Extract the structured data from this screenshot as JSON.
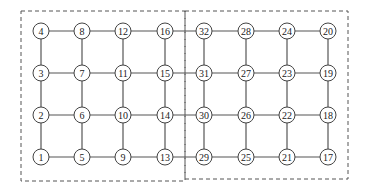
{
  "diagram": {
    "type": "mesh-network",
    "grid": {
      "columns": 8,
      "rows": 4
    },
    "column_x": [
      41,
      82,
      123,
      165,
      204,
      246,
      287,
      328
    ],
    "row_y": [
      31,
      73,
      115,
      157
    ],
    "node_radius": 8,
    "layout": [
      [
        "4",
        "8",
        "12",
        "16",
        "32",
        "28",
        "24",
        "20"
      ],
      [
        "3",
        "7",
        "11",
        "15",
        "31",
        "27",
        "23",
        "19"
      ],
      [
        "2",
        "6",
        "10",
        "14",
        "30",
        "26",
        "22",
        "18"
      ],
      [
        "1",
        "5",
        "9",
        "13",
        "29",
        "25",
        "21",
        "17"
      ]
    ],
    "partitions": [
      {
        "name": "left-partition",
        "x": 21,
        "y": 11,
        "w": 164,
        "h": 170
      },
      {
        "name": "right-partition",
        "x": 185,
        "y": 11,
        "w": 163,
        "h": 168
      }
    ],
    "colors": {
      "stroke": "#555555",
      "node_fill": "#ffffff",
      "text": "#222222"
    }
  }
}
